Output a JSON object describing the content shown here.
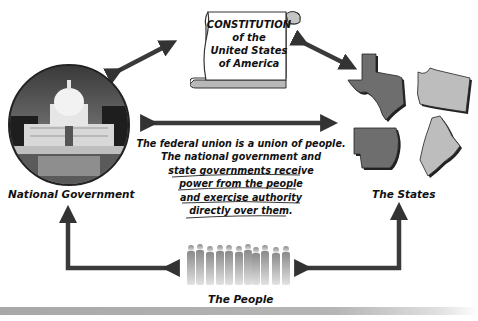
{
  "diagram": {
    "constitution": {
      "lines": [
        "CONSTITUTION",
        "of the",
        "United States",
        "of America"
      ]
    },
    "nodes": {
      "national_government": "National Government",
      "the_states": "The States",
      "the_people": "The People"
    },
    "center_text": {
      "lines": [
        "The federal union is a union of people.",
        "The national government and",
        "state governments receive",
        "power from the people",
        "and exercise authority",
        "directly over them."
      ]
    },
    "states_shown": [
      "Texas",
      "Washington",
      "Arkansas",
      "Maine"
    ],
    "colors": {
      "arrow": "#3a3a3a",
      "dark_state": "#6e6e6e",
      "light_state": "#bdbdbd",
      "scroll_fill": "#ffffff",
      "scroll_shadow": "#b0b0b0",
      "bottom_bar": "#b0b0b0"
    }
  }
}
